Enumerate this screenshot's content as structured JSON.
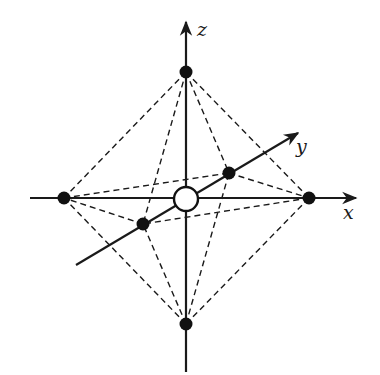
{
  "diagram": {
    "axes": {
      "x": {
        "label": "x"
      },
      "y": {
        "label": "y"
      },
      "z": {
        "label": "z"
      }
    },
    "nodes": [
      {
        "id": "top",
        "axis": "+z",
        "cx": 186,
        "cy": 72
      },
      {
        "id": "bottom",
        "axis": "-z",
        "cx": 186,
        "cy": 324
      },
      {
        "id": "left",
        "axis": "-x",
        "cx": 64,
        "cy": 198
      },
      {
        "id": "right",
        "axis": "+x",
        "cx": 309,
        "cy": 198
      },
      {
        "id": "back",
        "axis": "+y",
        "cx": 229,
        "cy": 173
      },
      {
        "id": "front",
        "axis": "-y",
        "cx": 143,
        "cy": 224
      }
    ],
    "center": {
      "cx": 186,
      "cy": 199,
      "r": 12,
      "style": "open-circle"
    },
    "edge_style": "dashed",
    "colors": {
      "stroke": "#1a1a1a",
      "background": "#ffffff"
    }
  }
}
